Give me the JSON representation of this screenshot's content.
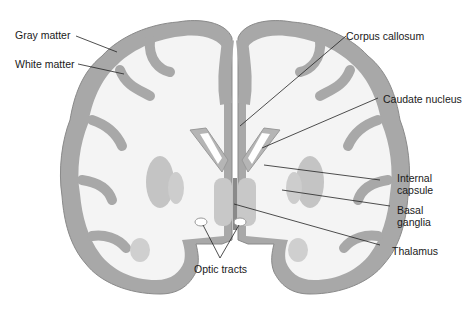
{
  "diagram": {
    "type": "anatomical-illustration",
    "colors": {
      "gray_matter": "#a8a8a8",
      "gray_matter_edge": "#8a8a8a",
      "white_matter": "#f4f4f4",
      "deep_nuclei": "#bdbdbd",
      "leader_line": "#222222",
      "text": "#1a1a1a"
    },
    "labels": {
      "gray_matter": "Gray matter",
      "white_matter": "White matter",
      "corpus_callosum": "Corpus callosum",
      "caudate_nucleus": "Caudate nucleus",
      "internal_capsule_1": "Internal",
      "internal_capsule_2": "capsule",
      "basal_ganglia_1": "Basal",
      "basal_ganglia_2": "ganglia",
      "thalamus": "Thalamus",
      "optic_tracts": "Optic tracts"
    }
  }
}
